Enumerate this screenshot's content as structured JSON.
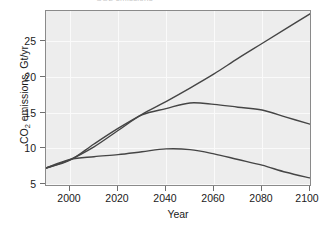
{
  "figure": {
    "clipped_title": "CO2 emissions",
    "background_color": "#ffffff",
    "plot_background_color": "#ededed",
    "gridline_color": "#fafafa",
    "axis_color": "#8a8a8a",
    "line_color": "#454545"
  },
  "axes": {
    "y_title_main": "CO",
    "y_title_sub": "2",
    "y_title_rest": " emissions, Gt/yr",
    "x_title": "Year",
    "y_ticks": [
      "5",
      "10",
      "15",
      "20",
      "25"
    ],
    "x_ticks": [
      "2000",
      "2020",
      "2040",
      "2060",
      "2080",
      "2100"
    ]
  },
  "chart_data": {
    "type": "line",
    "title": "CO2 emissions",
    "xlabel": "Year",
    "ylabel": "CO2 emissions, Gt/yr",
    "xlim": [
      1990,
      2100
    ],
    "ylim": [
      4.6,
      29.2
    ],
    "grid": true,
    "legend": "none",
    "x": [
      1990,
      2000,
      2010,
      2020,
      2030,
      2040,
      2050,
      2060,
      2070,
      2080,
      2090,
      2100
    ],
    "series": [
      {
        "name": "High growth scenario",
        "values": [
          7.0,
          8.1,
          10.4,
          12.6,
          14.6,
          16.4,
          18.3,
          20.3,
          22.5,
          24.6,
          26.7,
          28.8
        ]
      },
      {
        "name": "Stabilization scenario",
        "values": [
          7.0,
          8.2,
          10.0,
          12.3,
          14.5,
          15.4,
          16.2,
          16.0,
          15.6,
          15.2,
          14.2,
          13.2
        ]
      },
      {
        "name": "Mitigation scenario",
        "values": [
          7.0,
          8.2,
          8.6,
          8.9,
          9.3,
          9.7,
          9.6,
          9.0,
          8.2,
          7.4,
          6.4,
          5.6
        ]
      }
    ]
  }
}
